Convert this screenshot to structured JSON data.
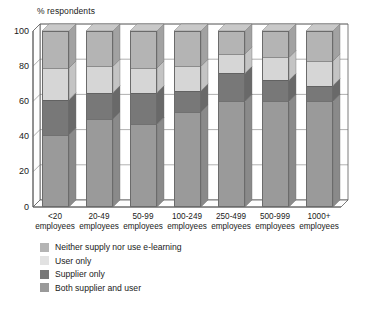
{
  "chart_data": {
    "type": "bar",
    "subtype": "stacked-100-percent-3d",
    "title": "",
    "ylabel": "% respondents",
    "xlabel": "",
    "ylim": [
      0,
      100
    ],
    "yticks": [
      0,
      20,
      40,
      60,
      80,
      100
    ],
    "grid": true,
    "legend_position": "below-plot-left",
    "categories": [
      "<20 employees",
      "20-49 employees",
      "50-99 employees",
      "100-249 employees",
      "250-499 employees",
      "500-999 employees",
      "1000+ employees"
    ],
    "category_lines": [
      [
        "<20",
        "employees"
      ],
      [
        "20-49",
        "employees"
      ],
      [
        "50-99",
        "employees"
      ],
      [
        "100-249",
        "employees"
      ],
      [
        "250-499",
        "employees"
      ],
      [
        "500-999",
        "employees"
      ],
      [
        "1000+",
        "employees"
      ]
    ],
    "series": [
      {
        "name": "Both supplier and user",
        "color": "#9a9a9a",
        "side_color": "#8a8a8a",
        "values": [
          41,
          50,
          47,
          54,
          60,
          60,
          60
        ]
      },
      {
        "name": "Supplier only",
        "color": "#787878",
        "side_color": "#696969",
        "values": [
          20,
          15,
          18,
          12,
          16,
          12,
          9
        ]
      },
      {
        "name": "User only",
        "color": "#d6d6d6",
        "side_color": "#c4c4c4",
        "values": [
          18,
          15,
          14,
          14,
          11,
          13,
          14
        ]
      },
      {
        "name": "Neither supply nor use e-learning",
        "color": "#b4b4b4",
        "side_color": "#a2a2a2",
        "values": [
          21,
          20,
          21,
          20,
          13,
          15,
          17
        ]
      }
    ],
    "stack_order_bottom_to_top": [
      "Both supplier and user",
      "Supplier only",
      "User only",
      "Neither supply nor use e-learning"
    ]
  },
  "legend": {
    "items": [
      {
        "label": "Neither supply nor use e-learning",
        "color": "#b4b4b4"
      },
      {
        "label": "User only",
        "color": "#e2e2e2"
      },
      {
        "label": "Supplier only",
        "color": "#787878"
      },
      {
        "label": "Both supplier and user",
        "color": "#9a9a9a"
      }
    ]
  },
  "yticks": [
    {
      "label": "100"
    },
    {
      "label": "80"
    },
    {
      "label": "60"
    },
    {
      "label": "40"
    },
    {
      "label": "20"
    },
    {
      "label": "0"
    }
  ],
  "colors": {
    "axis": "#3c3c3c",
    "text": "#1a1a1a",
    "background": "#ffffff",
    "plot_back_wall": "#ffffff"
  }
}
